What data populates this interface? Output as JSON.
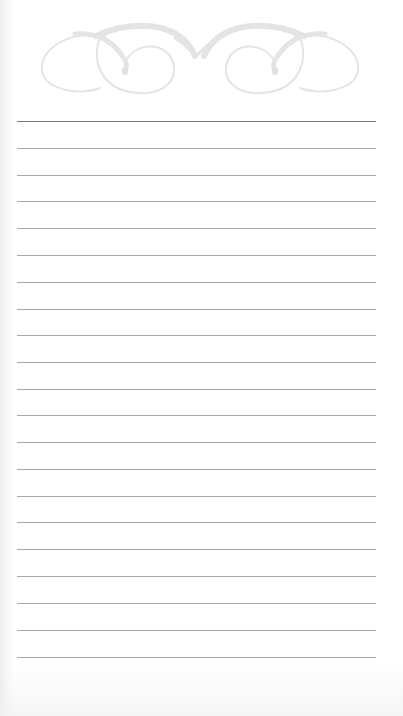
{
  "page": {
    "type": "lined notepad page",
    "background_color": "#ffffff",
    "line_color": "#a8a8a8",
    "first_line_color": "#7a7a7a",
    "flourish_color": "#e2e2e2"
  },
  "header": {
    "ornament": "flourish-icon"
  },
  "lines": {
    "count": 21,
    "left": 17,
    "right": 376,
    "positions": [
      121,
      148,
      175,
      201,
      228,
      255,
      282,
      309,
      335,
      362,
      389,
      415,
      442,
      469,
      496,
      522,
      549,
      576,
      603,
      630,
      657
    ]
  }
}
